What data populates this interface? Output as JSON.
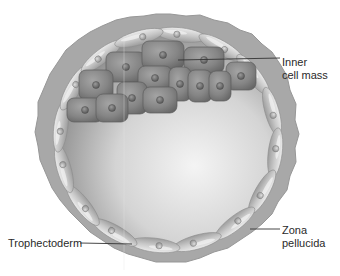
{
  "diagram": {
    "labels": {
      "inner_cell_mass": [
        "Inner",
        "cell mass"
      ],
      "zona_pellucida": [
        "Zona",
        "pellucida"
      ],
      "trophectoderm": [
        "Trophectoderm"
      ]
    },
    "colors": {
      "background": "#ffffff",
      "zona": "#a9a9a9",
      "zona_edge": "#8f8f8f",
      "trophectoderm_cell": "#c9c9c9",
      "trophectoderm_highlight": "#e8e8e8",
      "icm_cell": "#8a8a8a",
      "icm_cell_dark": "#6c6c6c",
      "nucleus": "#6a6a6a",
      "cavity_light": "#f2f2f2",
      "cavity_dark": "#9a9a9a",
      "leader_line": "#333333",
      "text": "#2a2a2a"
    }
  }
}
